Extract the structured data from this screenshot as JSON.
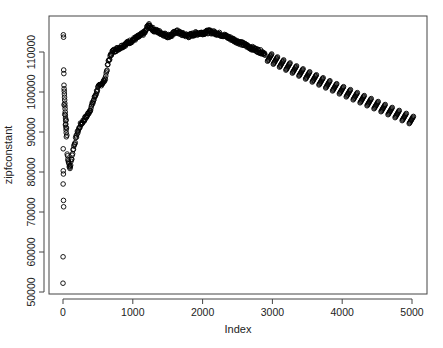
{
  "chart_data": {
    "type": "scatter",
    "title": "",
    "xlabel": "Index",
    "ylabel": "zipfconstant",
    "xlim": [
      -100,
      5200
    ],
    "ylim": [
      50000,
      117500
    ],
    "xticks": [
      0,
      1000,
      2000,
      3000,
      4000,
      5000
    ],
    "xtick_labels": [
      "0",
      "1000",
      "2000",
      "3000",
      "4000",
      "5000"
    ],
    "yticks": [
      50000,
      60000,
      70000,
      80000,
      90000,
      100000,
      110000
    ],
    "ytick_labels": [
      "50000",
      "60000",
      "70000",
      "80000",
      "90000",
      "100000",
      "110000"
    ],
    "grid": false,
    "legend": null,
    "marker": "open-circle",
    "marker_color": "#000000",
    "point_count_approx": 5000,
    "early_scatter_points": [
      {
        "x": 5,
        "y": 114300
      },
      {
        "x": 8,
        "y": 113700
      },
      {
        "x": 10,
        "y": 105500
      },
      {
        "x": 12,
        "y": 104600
      },
      {
        "x": 14,
        "y": 101700
      },
      {
        "x": 16,
        "y": 100800
      },
      {
        "x": 18,
        "y": 100200
      },
      {
        "x": 20,
        "y": 99500
      },
      {
        "x": 22,
        "y": 98700
      },
      {
        "x": 24,
        "y": 98000
      },
      {
        "x": 26,
        "y": 97200
      },
      {
        "x": 28,
        "y": 96500
      },
      {
        "x": 30,
        "y": 95800
      },
      {
        "x": 32,
        "y": 95000
      },
      {
        "x": 34,
        "y": 94200
      },
      {
        "x": 36,
        "y": 93500
      },
      {
        "x": 38,
        "y": 92800
      },
      {
        "x": 40,
        "y": 92000
      },
      {
        "x": 42,
        "y": 91200
      },
      {
        "x": 44,
        "y": 90500
      },
      {
        "x": 46,
        "y": 89800
      },
      {
        "x": 48,
        "y": 88800
      },
      {
        "x": 15,
        "y": 96800
      },
      {
        "x": 25,
        "y": 94400
      },
      {
        "x": 35,
        "y": 91800
      },
      {
        "x": 45,
        "y": 93000
      },
      {
        "x": 50,
        "y": 91000
      },
      {
        "x": 55,
        "y": 89200
      },
      {
        "x": 3,
        "y": 85800
      },
      {
        "x": 4,
        "y": 80300
      },
      {
        "x": 6,
        "y": 79500
      },
      {
        "x": 2,
        "y": 77000
      },
      {
        "x": 7,
        "y": 72900
      },
      {
        "x": 9,
        "y": 71300
      },
      {
        "x": 1,
        "y": 58800
      },
      {
        "x": 0,
        "y": 52200
      }
    ],
    "main_series": [
      {
        "x": 60,
        "y": 84500
      },
      {
        "x": 80,
        "y": 82500
      },
      {
        "x": 100,
        "y": 80800
      },
      {
        "x": 120,
        "y": 83000
      },
      {
        "x": 150,
        "y": 86000
      },
      {
        "x": 200,
        "y": 89500
      },
      {
        "x": 250,
        "y": 91800
      },
      {
        "x": 300,
        "y": 93000
      },
      {
        "x": 350,
        "y": 94200
      },
      {
        "x": 400,
        "y": 96000
      },
      {
        "x": 450,
        "y": 98500
      },
      {
        "x": 500,
        "y": 101000
      },
      {
        "x": 550,
        "y": 102000
      },
      {
        "x": 600,
        "y": 103000
      },
      {
        "x": 650,
        "y": 107500
      },
      {
        "x": 700,
        "y": 110000
      },
      {
        "x": 800,
        "y": 111000
      },
      {
        "x": 900,
        "y": 112000
      },
      {
        "x": 1000,
        "y": 113000
      },
      {
        "x": 1100,
        "y": 114000
      },
      {
        "x": 1180,
        "y": 115000
      },
      {
        "x": 1220,
        "y": 116800
      },
      {
        "x": 1300,
        "y": 115500
      },
      {
        "x": 1400,
        "y": 114800
      },
      {
        "x": 1500,
        "y": 114000
      },
      {
        "x": 1560,
        "y": 114200
      },
      {
        "x": 1620,
        "y": 115200
      },
      {
        "x": 1700,
        "y": 114500
      },
      {
        "x": 1800,
        "y": 114000
      },
      {
        "x": 1900,
        "y": 114600
      },
      {
        "x": 2000,
        "y": 114800
      },
      {
        "x": 2100,
        "y": 115100
      },
      {
        "x": 2200,
        "y": 114700
      },
      {
        "x": 2300,
        "y": 114200
      },
      {
        "x": 2400,
        "y": 113400
      },
      {
        "x": 2500,
        "y": 112600
      },
      {
        "x": 2600,
        "y": 111800
      },
      {
        "x": 2700,
        "y": 111000
      },
      {
        "x": 2800,
        "y": 110300
      },
      {
        "x": 2900,
        "y": 109600
      }
    ],
    "dash_segments": {
      "description": "after index ~2950 the points form short rising diagonal runs (block-wise sawtooth)",
      "count": 22,
      "start_index": 2960,
      "end_index": 4990,
      "start_center_value": 108600,
      "end_center_value": 93000,
      "segment_value_span": 1800,
      "segment_index_span": 60
    }
  }
}
